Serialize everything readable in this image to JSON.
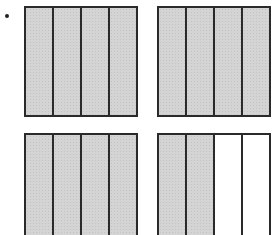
{
  "figure": {
    "shade_color": "#d4d4d4",
    "line_color": "#2a2a2a",
    "boxes": [
      {
        "id": "top-left",
        "parts": 4,
        "shaded": 4,
        "x": 24,
        "y": 6
      },
      {
        "id": "top-right",
        "parts": 4,
        "shaded": 4,
        "x": 157,
        "y": 6
      },
      {
        "id": "bottom-left",
        "parts": 4,
        "shaded": 4,
        "x": 24,
        "y": 133
      },
      {
        "id": "bottom-right",
        "parts": 4,
        "shaded": 2,
        "x": 157,
        "y": 133
      }
    ],
    "total_shaded_fraction": "14/4"
  }
}
